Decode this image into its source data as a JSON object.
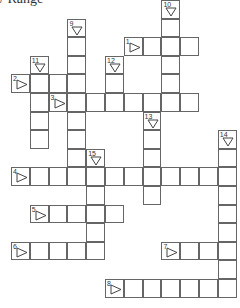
{
  "title": "/ Range",
  "grid": {
    "origin_x": 11,
    "origin_y": 0,
    "cell_w": 18.8,
    "cell_h": 18.6,
    "line_color": "#666666",
    "words": [
      {
        "number": "1",
        "direction": "across",
        "row": 2,
        "col": 6,
        "length": 4
      },
      {
        "number": "2",
        "direction": "across",
        "row": 4,
        "col": 0,
        "length": 4
      },
      {
        "number": "3",
        "direction": "across",
        "row": 5,
        "col": 2,
        "length": 8
      },
      {
        "number": "4",
        "direction": "across",
        "row": 9,
        "col": 0,
        "length": 12
      },
      {
        "number": "5",
        "direction": "across",
        "row": 11,
        "col": 1,
        "length": 5
      },
      {
        "number": "6",
        "direction": "across",
        "row": 13,
        "col": 0,
        "length": 5
      },
      {
        "number": "7",
        "direction": "across",
        "row": 13,
        "col": 8,
        "length": 4
      },
      {
        "number": "8",
        "direction": "across",
        "row": 15,
        "col": 5,
        "length": 7
      },
      {
        "number": "9",
        "direction": "down",
        "row": 1,
        "col": 3,
        "length": 9
      },
      {
        "number": "10",
        "direction": "down",
        "row": 0,
        "col": 8,
        "length": 6
      },
      {
        "number": "11",
        "direction": "down",
        "row": 3,
        "col": 1,
        "length": 5
      },
      {
        "number": "12",
        "direction": "down",
        "row": 3,
        "col": 5,
        "length": 3
      },
      {
        "number": "13",
        "direction": "down",
        "row": 6,
        "col": 7,
        "length": 5
      },
      {
        "number": "14",
        "direction": "down",
        "row": 7,
        "col": 11,
        "length": 9
      },
      {
        "number": "15",
        "direction": "down",
        "row": 8,
        "col": 4,
        "length": 6
      }
    ]
  },
  "icons": {
    "across": "right-triangle-arrow",
    "down": "down-triangle-arrow"
  }
}
